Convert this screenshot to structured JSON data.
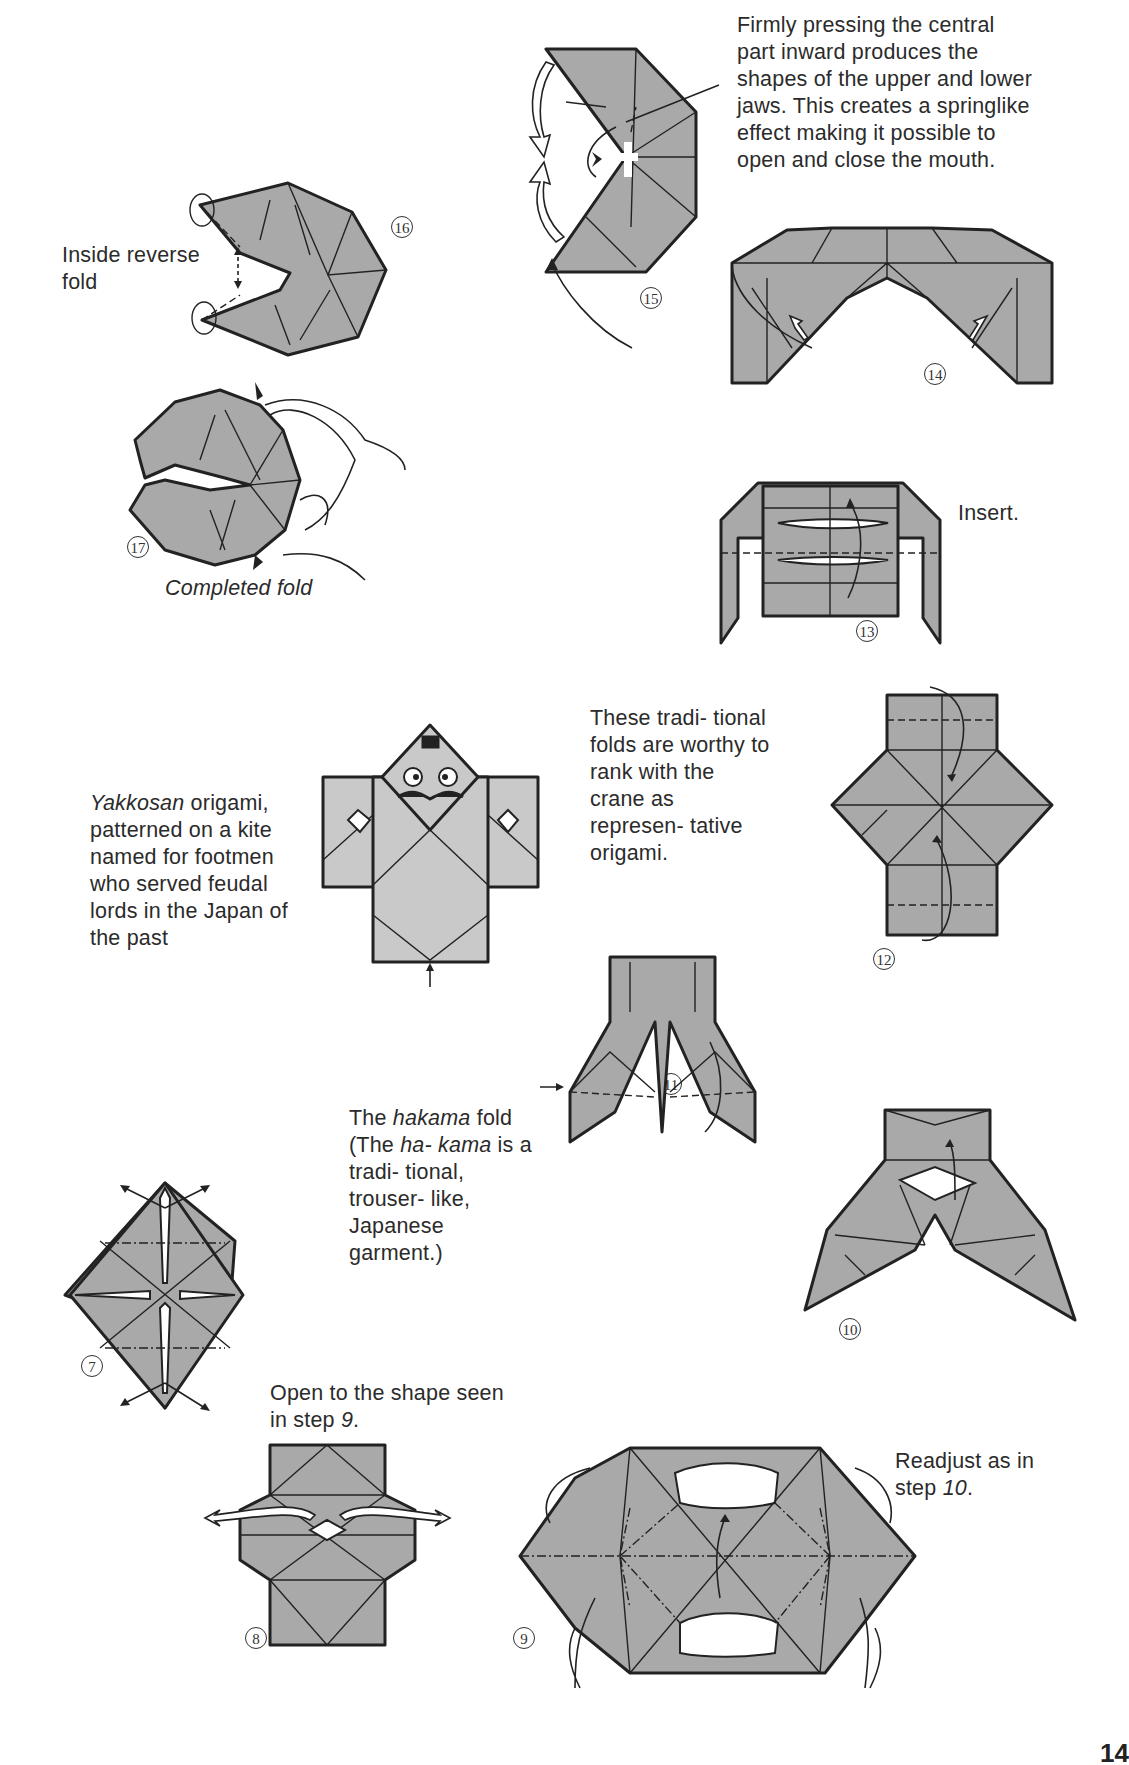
{
  "page": {
    "page_number": "14"
  },
  "captions": {
    "firmly_pressing": "Firmly pressing the central part inward produces the shapes of the upper and lower jaws. This creates a springlike effect making it possible to open and close the mouth.",
    "inside_reverse_fold_line1": "Inside reverse",
    "inside_reverse_fold_line2": "fold",
    "completed_fold": "Completed fold",
    "insert": "Insert.",
    "yakkosan_italic": "Yakkosan",
    "yakkosan_rest": " origami, patterned on a kite named for footmen who served feudal lords in the Japan of the past",
    "traditional_folds": "These tradi- tional folds are worthy to rank with the crane as represen- tative origami.",
    "hakama_1": "The ",
    "hakama_2": "hakama",
    "hakama_3": " fold  (The ",
    "hakama_4": "ha- kama",
    "hakama_5": " is a tradi- tional, trouser- like, Japanese garment.)",
    "open_to_shape_1": "Open to the shape seen in step ",
    "open_to_shape_2": "9",
    "open_to_shape_3": ".",
    "readjust_1": "Readjust as in step ",
    "readjust_2": "10",
    "readjust_3": "."
  },
  "steps": {
    "s7": "7",
    "s8": "8",
    "s9": "9",
    "s10": "10",
    "s11": "11",
    "s12": "12",
    "s13": "13",
    "s14": "14",
    "s15": "15",
    "s16": "16",
    "s17": "17"
  },
  "colors": {
    "paper_gray": "#a9a9a9",
    "light_gray": "#c9c9c9",
    "ink": "#222222",
    "background": "#ffffff"
  }
}
